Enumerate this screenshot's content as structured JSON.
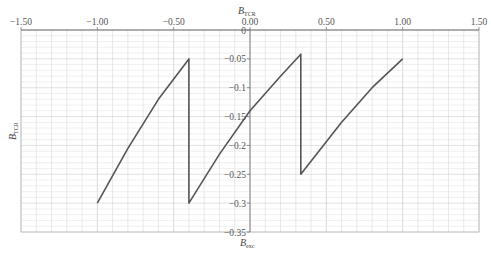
{
  "chart_data": {
    "type": "line",
    "title": "",
    "xlabel_top": "B_TCR",
    "xlabel_bottom": "B_exc",
    "ylabel": "B_TCR",
    "xlim": [
      -1.5,
      1.5
    ],
    "ylim": [
      -0.35,
      0
    ],
    "x_ticks": [
      "-1.50",
      "-1.00",
      "-0.50",
      "0.00",
      "0.50",
      "1.00",
      "1.50"
    ],
    "y_ticks": [
      "0",
      "-0.05",
      "-0.1",
      "-0.15",
      "-0.2",
      "-0.25",
      "-0.3",
      "-0.35"
    ],
    "grid": true,
    "legend": null,
    "series": [
      {
        "name": "B_TCR vs B_exc",
        "color": "#555555",
        "points": [
          [
            -1.0,
            -0.3
          ],
          [
            -0.8,
            -0.205
          ],
          [
            -0.6,
            -0.12
          ],
          [
            -0.4,
            -0.05
          ],
          [
            -0.4,
            -0.3
          ],
          [
            -0.2,
            -0.215
          ],
          [
            0.0,
            -0.14
          ],
          [
            0.2,
            -0.08
          ],
          [
            0.333,
            -0.042
          ],
          [
            0.333,
            -0.25
          ],
          [
            0.6,
            -0.16
          ],
          [
            0.8,
            -0.1
          ],
          [
            1.0,
            -0.05
          ]
        ]
      }
    ]
  },
  "labels": {
    "x_top_main": "B",
    "x_top_sub": "TCR",
    "x_bottom_main": "B",
    "x_bottom_sub": "exc",
    "y_main": "B",
    "y_sub": "TCR"
  }
}
